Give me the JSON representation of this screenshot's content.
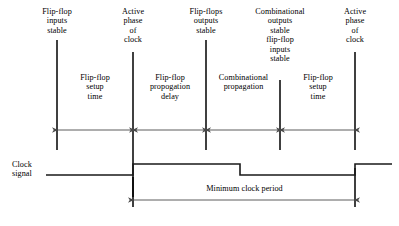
{
  "diagram": {
    "title_events": [
      {
        "name": "flip-flop-inputs-stable",
        "text": "Flip-flop\ninputs\nstable"
      },
      {
        "name": "active-phase-of-clock-first",
        "text": "Active\nphase\nof\nclock"
      },
      {
        "name": "flip-flops-outputs-stable",
        "text": "Flip-flops\noutputs\nstable"
      },
      {
        "name": "combinational-outputs-stable",
        "text": "Combinational\noutputs\nstable\nflip-flop\ninputs\nstable"
      },
      {
        "name": "active-phase-of-clock-second",
        "text": "Active\nphase\nof\nclock"
      }
    ],
    "intervals": [
      {
        "name": "flip-flop-setup-time-first",
        "text": "Flip-flop\nsetup\ntime"
      },
      {
        "name": "flip-flop-propogation-delay",
        "text": "Flip-flop\npropogation\ndelay"
      },
      {
        "name": "combinational-propagation",
        "text": "Combinational\npropagation"
      },
      {
        "name": "flip-flop-setup-time-second",
        "text": "Flip-flop\nsetup\ntime"
      }
    ],
    "clock_signal_label": "Clock\nsignal",
    "minimum_clock_period_label": "Minimum clock period",
    "colors": {
      "line": "#000000",
      "dimension_line": "#4a4a4a",
      "background": "#ffffff",
      "text": "#000000"
    },
    "geometry": {
      "event_line_x": [
        57,
        133,
        206,
        280,
        355
      ],
      "event_line_top_y": [
        40,
        52,
        40,
        80,
        52
      ],
      "event_line_bottom_y": 150,
      "interval_arrow_y": 130,
      "clock_baseline_y": 175,
      "clock_high_y": 164,
      "clock_start_x": 46,
      "clock_rise1_x": 133,
      "clock_fall1_x": 240,
      "clock_rise2_x": 355,
      "clock_end_x": 392,
      "period_arrow_y": 200,
      "period_from_x": 133,
      "period_to_x": 355
    }
  }
}
